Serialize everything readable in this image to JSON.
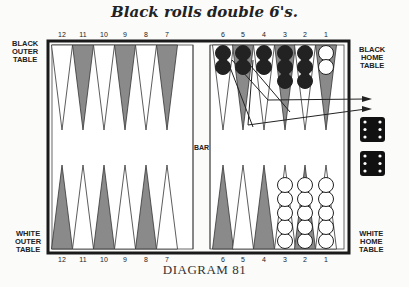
{
  "title": "Black rolls double 6's.",
  "caption": "DIAGRAM 81",
  "labels": {
    "black_outer": "BLACK OUTER TABLE",
    "black_outer_lines": [
      "BLACK",
      "OUTER",
      "TABLE"
    ],
    "black_home_lines": [
      "BLACK",
      "HOME",
      "TABLE"
    ],
    "white_outer_lines": [
      "WHITE",
      "OUTER",
      "TABLE"
    ],
    "white_home_lines": [
      "WHITE",
      "HOME",
      "TABLE"
    ],
    "bar": "BAR"
  },
  "top_points": [
    "12",
    "11",
    "10",
    "9",
    "8",
    "7",
    "6",
    "5",
    "4",
    "3",
    "2",
    "1"
  ],
  "bottom_points": [
    "12",
    "11",
    "10",
    "9",
    "8",
    "7",
    "6",
    "5",
    "4",
    "3",
    "2",
    "1"
  ],
  "checkers": {
    "black_home": [
      {
        "point": "6",
        "color": "black",
        "count": 2
      },
      {
        "point": "5",
        "color": "black",
        "count": 2
      },
      {
        "point": "4",
        "color": "black",
        "count": 2
      },
      {
        "point": "3",
        "color": "black",
        "count": 3
      },
      {
        "point": "2",
        "color": "black",
        "count": 3
      },
      {
        "point": "1",
        "color": "white",
        "count": 2
      }
    ],
    "white_home": [
      {
        "point": "3",
        "color": "white",
        "count": 5
      },
      {
        "point": "2",
        "color": "white",
        "count": 5
      },
      {
        "point": "1",
        "color": "white",
        "count": 5
      }
    ]
  },
  "dice": [
    {
      "value": 6
    },
    {
      "value": 6
    }
  ],
  "moves": "Two black checkers bear off from points 6 and 5 (arrows off the board)",
  "colors": {
    "board_border": "#1a1a1a",
    "dark_point": "#8a8a8a",
    "light_point": "#ffffff",
    "black_checker": "#222222",
    "white_checker": "#ffffff",
    "die": "#111111"
  }
}
